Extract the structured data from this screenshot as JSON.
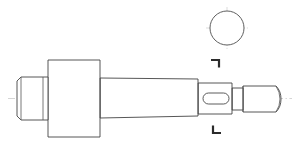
{
  "drawing": {
    "title": "Stepped Shaft Orthographic Drawing",
    "sheet": {
      "width": 300,
      "height": 150,
      "background_color": "#ffffff",
      "line_color": "#444444",
      "centerline_color": "#b9b9b9",
      "section_mark_color": "#2b2b2b"
    },
    "views": [
      {
        "name": "front-elevation-view",
        "label": "Front Elevation",
        "axis_y": 98.5
      },
      {
        "name": "section-end-view",
        "label": "Section End View",
        "shape": "circle",
        "center_x": 227,
        "center_y": 28,
        "radius": 17
      }
    ],
    "features": [
      {
        "name": "left-chamfered-stub",
        "label": "Left Chamfered Stub",
        "x_start": 17,
        "x_end": 48,
        "top": 77,
        "bottom": 120,
        "chamfer": 4
      },
      {
        "name": "flange-block",
        "label": "Flange Block",
        "x_start": 48,
        "x_end": 100,
        "top": 60,
        "bottom": 137
      },
      {
        "name": "tapered-main-body",
        "label": "Tapered Main Body",
        "x_start": 100,
        "x_end": 198,
        "left_top": 78,
        "left_bottom": 118,
        "right_top": 79,
        "right_bottom": 116
      },
      {
        "name": "keyway-slot-section",
        "label": "Keyway Slot Section",
        "x_start": 198,
        "x_end": 232,
        "top": 83,
        "bottom": 114
      },
      {
        "name": "keyway-slot",
        "label": "Keyway Slot",
        "x": 203,
        "y": 93,
        "width": 26,
        "height": 11,
        "corner_radius": 5.5
      },
      {
        "name": "shoulder-step",
        "label": "Shoulder Step",
        "x": 232,
        "top": 88,
        "bottom": 110
      },
      {
        "name": "domed-right-tip",
        "label": "Domed Right Tip",
        "x_start": 243,
        "x_end": 281,
        "top": 86,
        "bottom": 112,
        "dome_radius": 5
      }
    ],
    "annotations": [
      {
        "name": "section-mark-upper",
        "label": "Upper Cutting Plane Mark",
        "x": 218,
        "y": 60,
        "orientation": "top-left-corner"
      },
      {
        "name": "section-mark-lower",
        "label": "Lower Cutting Plane Mark",
        "x": 218,
        "y": 133,
        "orientation": "bottom-right-corner"
      }
    ],
    "centerlines": [
      {
        "name": "main-horizontal-centerline",
        "x1": 8,
        "y1": 98.5,
        "x2": 292,
        "y2": 98.5
      },
      {
        "name": "end-view-horizontal-centerline",
        "x1": 206,
        "y1": 28,
        "x2": 248,
        "y2": 28
      },
      {
        "name": "end-view-vertical-centerline",
        "x1": 227,
        "y1": 7,
        "x2": 227,
        "y2": 49
      }
    ]
  }
}
